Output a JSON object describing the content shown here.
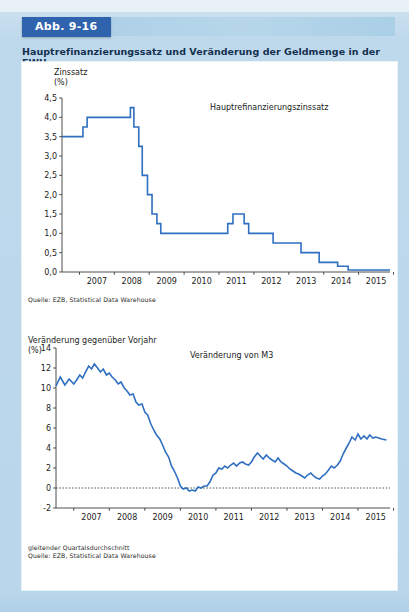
{
  "page": {
    "running_head": "",
    "figure_label": "Abb. 9-16",
    "figure_title": "Hauptrefinanzierungssatz und Veränderung der Geldmenge in der EWU",
    "accent_color": "#2f63ad",
    "series_color": "#2f6fc0",
    "background_color": "#bcd9ea",
    "panel_color": "#ffffff"
  },
  "chart_data": [
    {
      "id": "chart-interest-rate",
      "type": "line",
      "step": "post",
      "title": "",
      "annotation": "Hauptrefinanzierungszinssatz",
      "ylabel": "Zinssatz\n(%)",
      "xlabel": "",
      "ylim": [
        0.0,
        4.5
      ],
      "yticks": [
        0.0,
        0.5,
        1.0,
        1.5,
        2.0,
        2.5,
        3.0,
        3.5,
        4.0,
        4.5
      ],
      "ytick_labels": [
        "0,0",
        "0,5",
        "1,0",
        "1,5",
        "2,0",
        "2,5",
        "3,0",
        "3,5",
        "4,0",
        "4,5"
      ],
      "xlim": [
        2006.5,
        2015.9
      ],
      "xticks": [
        2007,
        2008,
        2009,
        2010,
        2011,
        2012,
        2013,
        2014,
        2015
      ],
      "xtick_labels": [
        "2007",
        "2008",
        "2009",
        "2010",
        "2011",
        "2012",
        "2013",
        "2014",
        "2015"
      ],
      "grid": false,
      "legend": "none",
      "source": "Quelle: EZB, Statistical Data Warehouse",
      "x": [
        2006.5,
        2007.1,
        2007.22,
        2007.45,
        2008.46,
        2008.56,
        2008.7,
        2008.8,
        2008.95,
        2009.08,
        2009.22,
        2009.33,
        2009.45,
        2011.25,
        2011.4,
        2011.52,
        2011.72,
        2011.85,
        2011.96,
        2012.55,
        2013.35,
        2013.87,
        2014.4,
        2014.7,
        2015.9
      ],
      "y": [
        3.5,
        3.75,
        4.0,
        4.0,
        4.25,
        3.75,
        3.25,
        2.5,
        2.0,
        1.5,
        1.25,
        1.0,
        1.0,
        1.25,
        1.5,
        1.5,
        1.25,
        1.0,
        1.0,
        0.75,
        0.5,
        0.25,
        0.15,
        0.05,
        0.05
      ]
    },
    {
      "id": "chart-m3-growth",
      "type": "line",
      "step": "none",
      "title": "",
      "annotation": "Veränderung von M3",
      "ylabel": "Veränderung gegenüber Vorjahr\n(%)",
      "xlabel": "",
      "ylim": [
        -2,
        14
      ],
      "yticks": [
        -2,
        0,
        2,
        4,
        6,
        8,
        10,
        12,
        14
      ],
      "ytick_labels": [
        "-2",
        "0",
        "2",
        "4",
        "6",
        "8",
        "10",
        "12",
        "14"
      ],
      "xlim": [
        2006.5,
        2015.9
      ],
      "xticks": [
        2007,
        2008,
        2009,
        2010,
        2011,
        2012,
        2013,
        2014,
        2015
      ],
      "xtick_labels": [
        "2007",
        "2008",
        "2009",
        "2010",
        "2011",
        "2012",
        "2013",
        "2014",
        "2015"
      ],
      "grid": false,
      "zero_line": true,
      "legend": "none",
      "footnote": "gleitender Quartalsdurchschnitt",
      "source": "Quelle: EZB, Statistical Data Warehouse",
      "x": [
        2006.5,
        2006.62,
        2006.75,
        2006.87,
        2007.0,
        2007.08,
        2007.17,
        2007.25,
        2007.33,
        2007.42,
        2007.5,
        2007.58,
        2007.67,
        2007.75,
        2007.83,
        2007.92,
        2008.0,
        2008.08,
        2008.17,
        2008.25,
        2008.33,
        2008.42,
        2008.5,
        2008.58,
        2008.67,
        2008.75,
        2008.83,
        2008.92,
        2009.0,
        2009.08,
        2009.17,
        2009.25,
        2009.33,
        2009.42,
        2009.5,
        2009.58,
        2009.67,
        2009.75,
        2009.83,
        2009.92,
        2010.0,
        2010.08,
        2010.17,
        2010.25,
        2010.33,
        2010.42,
        2010.5,
        2010.58,
        2010.67,
        2010.75,
        2010.83,
        2010.92,
        2011.0,
        2011.08,
        2011.17,
        2011.25,
        2011.33,
        2011.42,
        2011.5,
        2011.58,
        2011.67,
        2011.75,
        2011.83,
        2011.92,
        2012.0,
        2012.08,
        2012.17,
        2012.25,
        2012.33,
        2012.42,
        2012.5,
        2012.58,
        2012.67,
        2012.75,
        2012.83,
        2012.92,
        2013.0,
        2013.08,
        2013.17,
        2013.25,
        2013.33,
        2013.42,
        2013.5,
        2013.58,
        2013.67,
        2013.75,
        2013.83,
        2013.92,
        2014.0,
        2014.08,
        2014.17,
        2014.25,
        2014.33,
        2014.42,
        2014.5,
        2014.58,
        2014.67,
        2014.75,
        2014.83,
        2014.92,
        2015.0,
        2015.08,
        2015.17,
        2015.25,
        2015.33,
        2015.42,
        2015.5,
        2015.58,
        2015.67,
        2015.8
      ],
      "y": [
        10.2,
        11.1,
        10.3,
        10.9,
        10.4,
        10.8,
        11.3,
        11.0,
        11.6,
        12.2,
        11.9,
        12.4,
        12.0,
        11.6,
        11.9,
        11.3,
        11.5,
        11.1,
        10.8,
        10.4,
        10.6,
        10.0,
        9.7,
        9.3,
        9.4,
        8.6,
        8.3,
        8.4,
        7.6,
        7.3,
        6.4,
        5.8,
        5.3,
        4.9,
        4.3,
        3.6,
        3.1,
        2.2,
        1.7,
        1.0,
        0.2,
        -0.1,
        0.0,
        -0.3,
        -0.2,
        -0.3,
        0.1,
        0.0,
        0.2,
        0.2,
        0.6,
        1.3,
        1.5,
        2.0,
        1.9,
        2.2,
        2.0,
        2.3,
        2.5,
        2.2,
        2.5,
        2.6,
        2.4,
        2.3,
        2.6,
        3.1,
        3.5,
        3.2,
        2.9,
        3.3,
        3.0,
        2.8,
        2.6,
        3.0,
        2.6,
        2.4,
        2.2,
        1.9,
        1.7,
        1.5,
        1.4,
        1.2,
        1.0,
        1.3,
        1.5,
        1.2,
        1.0,
        0.9,
        1.2,
        1.4,
        1.8,
        2.2,
        2.0,
        2.3,
        2.7,
        3.4,
        4.0,
        4.5,
        5.1,
        4.8,
        5.4,
        4.9,
        5.2,
        4.9,
        5.3,
        5.0,
        5.1,
        5.0,
        4.9,
        4.8
      ]
    }
  ]
}
